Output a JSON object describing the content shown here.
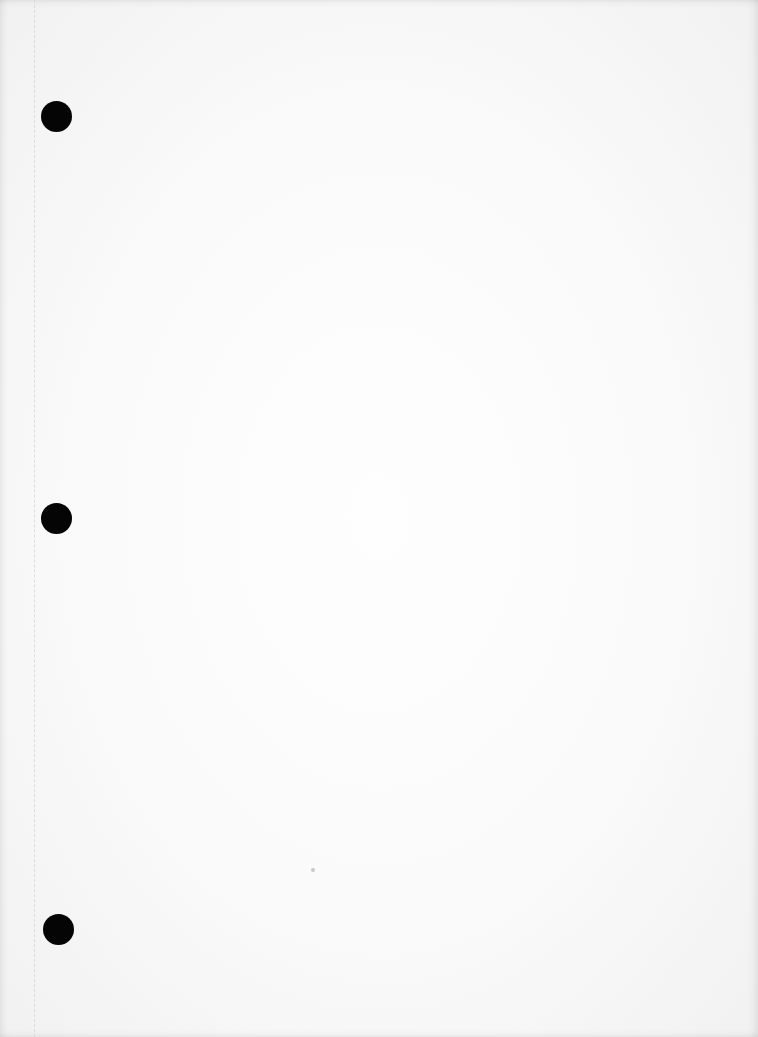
{
  "document": {
    "type": "blank three-hole punched sheet",
    "text_content": "",
    "paper_color": "#fafafa",
    "margin_line": {
      "x": 34,
      "style": "dashed",
      "color": "#dcdcdc"
    },
    "punch_holes": [
      {
        "cx": 56,
        "cy": 116,
        "diameter": 31,
        "color": "#050505"
      },
      {
        "cx": 56,
        "cy": 518,
        "diameter": 31,
        "color": "#050505"
      },
      {
        "cx": 58,
        "cy": 929,
        "diameter": 31,
        "color": "#050505"
      }
    ],
    "specks": [
      {
        "x": 313,
        "y": 870
      }
    ]
  }
}
